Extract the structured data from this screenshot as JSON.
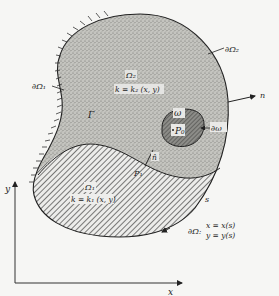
{
  "diagram": {
    "type": "domain decomposition with boundaries",
    "regions": {
      "omega2": {
        "name": "Ω₂",
        "formula": "k = k₂ (x, y)",
        "fill": "stipple",
        "color": "#b9b9b4"
      },
      "omega1": {
        "name": "Ω₁",
        "formula": "k = k₁ (x, y)",
        "fill": "diagonal-hatch",
        "color": "#9a9a96"
      },
      "hole": {
        "name": "ω",
        "point": "P₀",
        "boundary": "∂ω",
        "color": "#7c7c78"
      }
    },
    "boundaries": {
      "dOmega1": "∂Ω₁",
      "dOmega2": "∂Ω₂",
      "interface": "Γ",
      "dOmega": "∂Ω:",
      "param_x": "x = x(s)",
      "param_y": "y = y(s)",
      "arc_param": "s"
    },
    "vectors": {
      "outer_normal": "n",
      "interface_normal": "n̂",
      "interface_point": "P₁"
    },
    "axes": {
      "x_label": "x",
      "y_label": "y"
    }
  }
}
